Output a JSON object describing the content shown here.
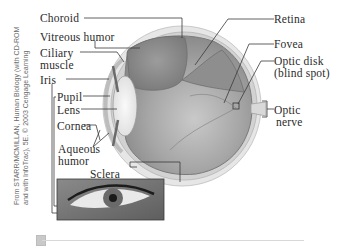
{
  "figure": {
    "labels": {
      "choroid": "Choroid",
      "vitreous_humor": "Vitreous humor",
      "ciliary_muscle_1": "Ciliary",
      "ciliary_muscle_2": "muscle",
      "iris": "Iris",
      "pupil": "Pupil",
      "lens": "Lens",
      "cornea": "Cornea",
      "aqueous_humor_1": "Aqueous",
      "aqueous_humor_2": "humor",
      "sclera": "Sclera",
      "retina": "Retina",
      "fovea": "Fovea",
      "optic_disk_1": "Optic disk",
      "optic_disk_2": "(blind spot)",
      "optic_nerve_1": "Optic",
      "optic_nerve_2": "nerve"
    },
    "credit": "From STARR/MCMILLAN, Human Biology (with CD-ROM and with InfoTrac), 5E. © 2003 Cengage Learning",
    "colors": {
      "label_text": "#2b2b2b",
      "leader_line": "#3a3a3a",
      "eyeball_fill": "#9a9a9a",
      "sclera_rim": "#d6d6d6"
    }
  }
}
